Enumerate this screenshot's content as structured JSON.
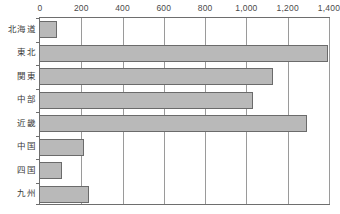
{
  "chart_data": {
    "type": "bar",
    "orientation": "horizontal",
    "title": "",
    "xlabel": "",
    "ylabel": "",
    "xlim": [
      0,
      1400
    ],
    "xticks": [
      0,
      200,
      400,
      600,
      800,
      1000,
      1200,
      1400
    ],
    "xtick_labels": [
      "0",
      "200",
      "400",
      "600",
      "800",
      "1,000",
      "1,200",
      "1,400"
    ],
    "grid": true,
    "legend": false,
    "categories": [
      "北海道",
      "東北",
      "関東",
      "中部",
      "近畿",
      "中国",
      "四国",
      "九州"
    ],
    "values": [
      80,
      1395,
      1130,
      1030,
      1295,
      215,
      105,
      235
    ],
    "series": [
      {
        "name": "",
        "values": [
          80,
          1395,
          1130,
          1030,
          1295,
          215,
          105,
          235
        ]
      }
    ]
  },
  "style": {
    "bar_fill": "#b9b9b9",
    "bar_border": "#6b6b6b",
    "frame_color": "#6e6e6e",
    "gridline_color": "#9a9a9a",
    "background": "#ffffff",
    "text_color": "#3a3a3a"
  }
}
